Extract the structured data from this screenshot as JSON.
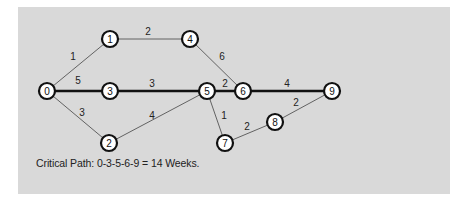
{
  "diagram": {
    "type": "network-critical-path",
    "background_color": "#d9d9d9",
    "node_fill": "#ffffff",
    "node_stroke": "#111111",
    "edge_color": "#555555",
    "critical_edge_color": "#111111",
    "nodes": [
      {
        "id": "0",
        "label": "0",
        "x": 47,
        "y": 91
      },
      {
        "id": "1",
        "label": "1",
        "x": 110,
        "y": 39
      },
      {
        "id": "2",
        "label": "2",
        "x": 109,
        "y": 143
      },
      {
        "id": "3",
        "label": "3",
        "x": 110,
        "y": 91
      },
      {
        "id": "4",
        "label": "4",
        "x": 190,
        "y": 39
      },
      {
        "id": "5",
        "label": "5",
        "x": 207,
        "y": 91
      },
      {
        "id": "6",
        "label": "6",
        "x": 243,
        "y": 91
      },
      {
        "id": "7",
        "label": "7",
        "x": 225,
        "y": 143
      },
      {
        "id": "8",
        "label": "8",
        "x": 275,
        "y": 122
      },
      {
        "id": "9",
        "label": "9",
        "x": 332,
        "y": 91
      }
    ],
    "edges": [
      {
        "from": "0",
        "to": "1",
        "weight": "1",
        "critical": false,
        "lx": 73,
        "ly": 60
      },
      {
        "from": "0",
        "to": "3",
        "weight": "5",
        "critical": true,
        "lx": 78,
        "ly": 84
      },
      {
        "from": "0",
        "to": "2",
        "weight": "3",
        "critical": false,
        "lx": 82,
        "ly": 116
      },
      {
        "from": "1",
        "to": "4",
        "weight": "2",
        "critical": false,
        "lx": 148,
        "ly": 35
      },
      {
        "from": "3",
        "to": "5",
        "weight": "3",
        "critical": true,
        "lx": 152,
        "ly": 87
      },
      {
        "from": "2",
        "to": "5",
        "weight": "4",
        "critical": false,
        "lx": 152,
        "ly": 119
      },
      {
        "from": "4",
        "to": "6",
        "weight": "6",
        "critical": false,
        "lx": 222,
        "ly": 60
      },
      {
        "from": "5",
        "to": "6",
        "weight": "2",
        "critical": true,
        "lx": 225,
        "ly": 87
      },
      {
        "from": "5",
        "to": "7",
        "weight": "1",
        "critical": false,
        "lx": 224,
        "ly": 119
      },
      {
        "from": "6",
        "to": "9",
        "weight": "4",
        "critical": true,
        "lx": 287,
        "ly": 87
      },
      {
        "from": "7",
        "to": "8",
        "weight": "2",
        "critical": false,
        "lx": 247,
        "ly": 130
      },
      {
        "from": "8",
        "to": "9",
        "weight": "2",
        "critical": false,
        "lx": 296,
        "ly": 106
      }
    ],
    "caption": "Critical Path: 0-3-5-6-9 =  14 Weeks."
  }
}
